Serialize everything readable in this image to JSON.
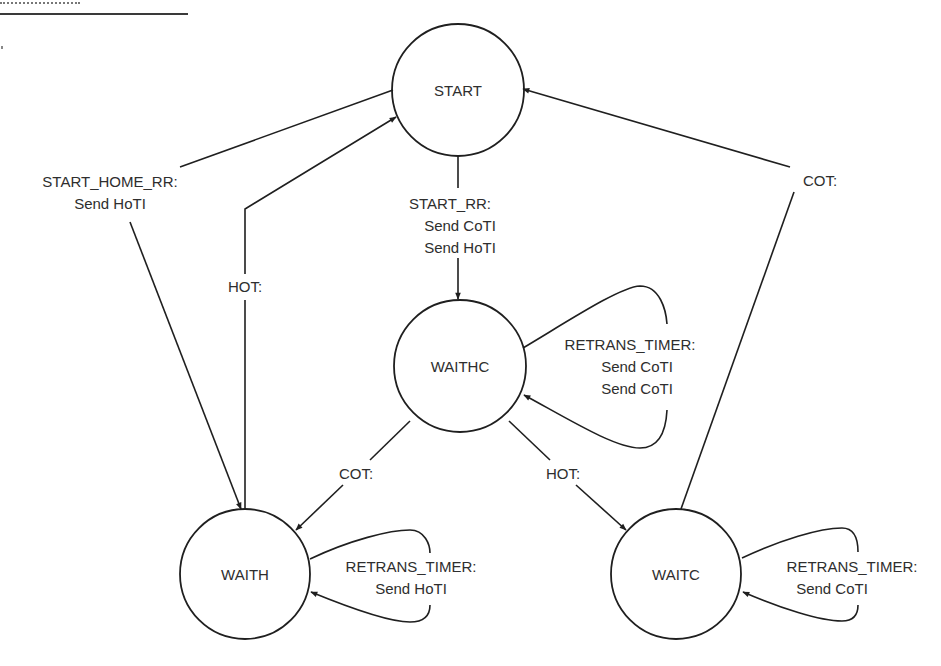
{
  "diagram": {
    "type": "state-machine",
    "colors": {
      "stroke": "#1f1f1f",
      "text": "#2e2e2e",
      "background": "#ffffff"
    },
    "states": [
      {
        "id": "start",
        "label": "START"
      },
      {
        "id": "waithc",
        "label": "WAITHC"
      },
      {
        "id": "waith",
        "label": "WAITH"
      },
      {
        "id": "waitc",
        "label": "WAITC"
      }
    ],
    "transitions": [
      {
        "id": "start-to-waith",
        "from": "START",
        "to": "WAITH",
        "lines": [
          "START_HOME_RR:",
          "Send HoTI"
        ]
      },
      {
        "id": "waith-to-start",
        "from": "WAITH",
        "to": "START",
        "lines": [
          "HOT:"
        ]
      },
      {
        "id": "start-to-waithc",
        "from": "START",
        "to": "WAITHC",
        "lines": [
          "START_RR:",
          "Send CoTI",
          "Send HoTI"
        ]
      },
      {
        "id": "waithc-self",
        "from": "WAITHC",
        "to": "WAITHC",
        "lines": [
          "RETRANS_TIMER:",
          "Send CoTI",
          "Send CoTI"
        ]
      },
      {
        "id": "waithc-to-waith",
        "from": "WAITHC",
        "to": "WAITH",
        "lines": [
          "COT:"
        ]
      },
      {
        "id": "waithc-to-waitc",
        "from": "WAITHC",
        "to": "WAITC",
        "lines": [
          "HOT:"
        ]
      },
      {
        "id": "waitc-to-start",
        "from": "WAITC",
        "to": "START",
        "lines": [
          "COT:"
        ]
      },
      {
        "id": "waith-self",
        "from": "WAITH",
        "to": "WAITH",
        "lines": [
          "RETRANS_TIMER:",
          "Send HoTI"
        ]
      },
      {
        "id": "waitc-self",
        "from": "WAITC",
        "to": "WAITC",
        "lines": [
          "RETRANS_TIMER:",
          "Send CoTI"
        ]
      }
    ]
  }
}
